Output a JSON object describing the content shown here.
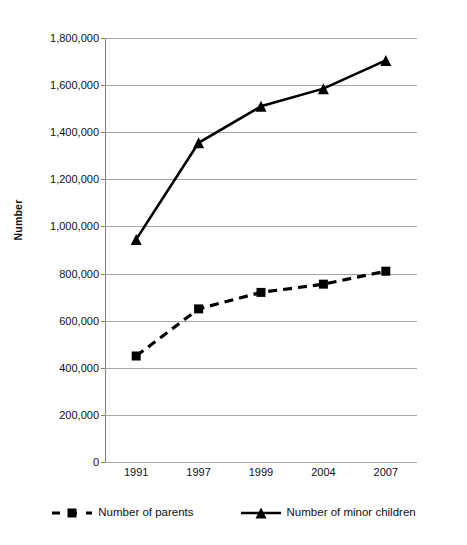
{
  "chart_data": {
    "type": "line",
    "title": "",
    "xlabel": "",
    "ylabel": "Number",
    "categories": [
      "1991",
      "1997",
      "1999",
      "2004",
      "2007"
    ],
    "ylim": [
      0,
      1800000
    ],
    "ytick_step": 200000,
    "ytick_labels": [
      "0",
      "200,000",
      "400,000",
      "600,000",
      "800,000",
      "1,000,000",
      "1,200,000",
      "1,400,000",
      "1,600,000",
      "1,800,000"
    ],
    "ytick_values": [
      0,
      200000,
      400000,
      600000,
      800000,
      1000000,
      1200000,
      1400000,
      1600000,
      1800000
    ],
    "grid": true,
    "legend_position": "bottom",
    "series": [
      {
        "name": "Number of parents",
        "values": [
          450000,
          650000,
          720000,
          755000,
          810000
        ],
        "marker": "square",
        "linestyle": "dashed",
        "color": "#000000"
      },
      {
        "name": "Number of minor children",
        "values": [
          945000,
          1355000,
          1510000,
          1585000,
          1705000
        ],
        "marker": "triangle",
        "linestyle": "solid",
        "color": "#000000"
      }
    ]
  },
  "axes": {
    "y_title": "Number",
    "grid_color": "#a6a6a6",
    "axis_color": "#808080"
  },
  "legend": {
    "items": [
      {
        "label": "Number of parents",
        "marker": "square-marker",
        "linestyle": "dashed"
      },
      {
        "label": "Number of minor children",
        "marker": "triangle-marker",
        "linestyle": "solid"
      }
    ]
  }
}
